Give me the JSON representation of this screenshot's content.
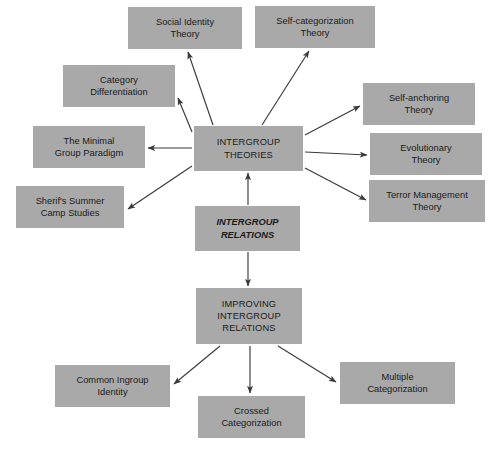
{
  "diagram": {
    "background_color": "#ffffff",
    "node_fill_color": "#a9a9a9",
    "text_color": "#1a1a1a",
    "arrow_color": "#3a3a3a",
    "nodes": [
      {
        "id": "social-identity-theory",
        "label": "Social Identity\nTheory",
        "x": 128,
        "y": 7,
        "w": 114,
        "h": 42,
        "style": "plain"
      },
      {
        "id": "self-categorization-theory",
        "label": "Self-categorization\nTheory",
        "x": 255,
        "y": 6,
        "w": 120,
        "h": 42,
        "style": "plain"
      },
      {
        "id": "category-differentiation",
        "label": "Category\nDifferentiation",
        "x": 63,
        "y": 65,
        "w": 112,
        "h": 42,
        "style": "plain"
      },
      {
        "id": "self-anchoring-theory",
        "label": "Self-anchoring\nTheory",
        "x": 363,
        "y": 83,
        "w": 112,
        "h": 42,
        "style": "plain"
      },
      {
        "id": "the-minimal-group-paradigm",
        "label": "The Minimal\nGroup Paradigm",
        "x": 33,
        "y": 126,
        "w": 112,
        "h": 42,
        "style": "plain"
      },
      {
        "id": "intergroup-theories",
        "label": "INTERGROUP\nTHEORIES",
        "x": 194,
        "y": 126,
        "w": 109,
        "h": 45,
        "style": "caps"
      },
      {
        "id": "evolutionary-theory",
        "label": "Evolutionary\nTheory",
        "x": 370,
        "y": 133,
        "w": 112,
        "h": 42,
        "style": "plain"
      },
      {
        "id": "sherifs-summer-camp-studies",
        "label": "Sherif's Summer\nCamp Studies",
        "x": 16,
        "y": 186,
        "w": 108,
        "h": 42,
        "style": "plain"
      },
      {
        "id": "terror-management-theory",
        "label": "Terror Management\nTheory",
        "x": 369,
        "y": 180,
        "w": 116,
        "h": 42,
        "style": "plain"
      },
      {
        "id": "intergroup-relations",
        "label": "INTERGROUP\nRELATIONS",
        "x": 195,
        "y": 206,
        "w": 105,
        "h": 45,
        "style": "emphasis"
      },
      {
        "id": "improving-intergroup-relations",
        "label": "IMPROVING\nINTERGROUP\nRELATIONS",
        "x": 196,
        "y": 288,
        "w": 106,
        "h": 56,
        "style": "caps"
      },
      {
        "id": "common-ingroup-identity",
        "label": "Common Ingroup\nIdentity",
        "x": 55,
        "y": 365,
        "w": 115,
        "h": 42,
        "style": "plain"
      },
      {
        "id": "multiple-categorization",
        "label": "Multiple\nCategorization",
        "x": 340,
        "y": 362,
        "w": 115,
        "h": 42,
        "style": "plain"
      },
      {
        "id": "crossed-categorization",
        "label": "Crossed\nCategorization",
        "x": 198,
        "y": 396,
        "w": 107,
        "h": 42,
        "style": "plain"
      }
    ],
    "edges": [
      {
        "id": "relations-to-theories",
        "from": "intergroup-relations",
        "to": "intergroup-theories",
        "x1": 248,
        "y1": 205,
        "x2": 248,
        "y2": 173
      },
      {
        "id": "theories-to-social-identity",
        "from": "intergroup-theories",
        "to": "social-identity-theory",
        "x1": 213,
        "y1": 125,
        "x2": 188,
        "y2": 52
      },
      {
        "id": "theories-to-self-categorization",
        "from": "intergroup-theories",
        "to": "self-categorization-theory",
        "x1": 262,
        "y1": 125,
        "x2": 309,
        "y2": 51
      },
      {
        "id": "theories-to-category-differentiation",
        "from": "intergroup-theories",
        "to": "category-differentiation",
        "x1": 192,
        "y1": 132,
        "x2": 178,
        "y2": 98
      },
      {
        "id": "theories-to-minimal-group",
        "from": "intergroup-theories",
        "to": "the-minimal-group-paradigm",
        "x1": 192,
        "y1": 148,
        "x2": 148,
        "y2": 148
      },
      {
        "id": "theories-to-sherif",
        "from": "intergroup-theories",
        "to": "sherifs-summer-camp-studies",
        "x1": 192,
        "y1": 166,
        "x2": 128,
        "y2": 209
      },
      {
        "id": "theories-to-self-anchoring",
        "from": "intergroup-theories",
        "to": "self-anchoring-theory",
        "x1": 305,
        "y1": 135,
        "x2": 360,
        "y2": 106
      },
      {
        "id": "theories-to-evolutionary",
        "from": "intergroup-theories",
        "to": "evolutionary-theory",
        "x1": 305,
        "y1": 152,
        "x2": 367,
        "y2": 155
      },
      {
        "id": "theories-to-terror-management",
        "from": "intergroup-theories",
        "to": "terror-management-theory",
        "x1": 305,
        "y1": 168,
        "x2": 366,
        "y2": 200
      },
      {
        "id": "relations-to-improving",
        "from": "intergroup-relations",
        "to": "improving-intergroup-relations",
        "x1": 248,
        "y1": 252,
        "x2": 248,
        "y2": 286
      },
      {
        "id": "improving-to-common-ingroup",
        "from": "improving-intergroup-relations",
        "to": "common-ingroup-identity",
        "x1": 220,
        "y1": 346,
        "x2": 174,
        "y2": 384
      },
      {
        "id": "improving-to-crossed",
        "from": "improving-intergroup-relations",
        "to": "crossed-categorization",
        "x1": 250,
        "y1": 346,
        "x2": 250,
        "y2": 393
      },
      {
        "id": "improving-to-multiple",
        "from": "improving-intergroup-relations",
        "to": "multiple-categorization",
        "x1": 278,
        "y1": 346,
        "x2": 336,
        "y2": 382
      }
    ]
  }
}
